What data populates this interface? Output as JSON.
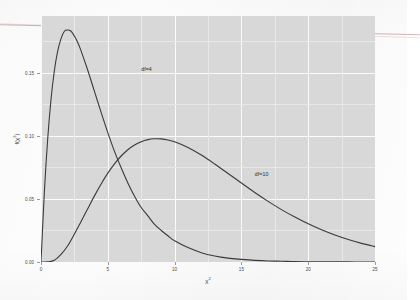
{
  "chart_data": {
    "type": "line",
    "title": "",
    "subtitle": "",
    "xlabel": "χ²",
    "ylabel": "f(χ²)",
    "xlim": [
      0,
      25
    ],
    "ylim": [
      0,
      0.195
    ],
    "grid": true,
    "legend": "none (in-plot curve annotations)",
    "panel_background": "#d8d8d8",
    "gridline_color": "#fbfbfb",
    "curve_color": "#3a3a3a",
    "x_ticks": [
      {
        "value": 0,
        "label": "0"
      },
      {
        "value": 5,
        "label": "5"
      },
      {
        "value": 10,
        "label": "10"
      },
      {
        "value": 15,
        "label": "15"
      },
      {
        "value": 20,
        "label": "20"
      },
      {
        "value": 25,
        "label": "25"
      }
    ],
    "y_ticks": [
      {
        "value": 0.0,
        "label": "0.00"
      },
      {
        "value": 0.05,
        "label": "0.05"
      },
      {
        "value": 0.1,
        "label": "0.10"
      },
      {
        "value": 0.15,
        "label": "0.15"
      }
    ],
    "annotations": [
      {
        "text": "df=4",
        "x": 7.5,
        "y": 0.155
      },
      {
        "text": "df=10",
        "x": 16.0,
        "y": 0.072
      }
    ],
    "series": [
      {
        "name": "df=4",
        "df": 4,
        "peak_x": 2.0,
        "peak_y": 0.1839,
        "x": [
          0,
          0.25,
          0.5,
          0.75,
          1,
          1.25,
          1.5,
          1.75,
          2,
          2.25,
          2.5,
          2.75,
          3,
          3.5,
          4,
          4.5,
          5,
          5.5,
          6,
          6.5,
          7,
          7.5,
          8,
          8.5,
          9,
          9.5,
          10,
          11,
          12,
          13,
          14,
          15,
          16,
          17,
          18,
          19,
          20,
          21,
          22,
          23,
          24,
          25
        ],
        "y": [
          0,
          0.0551,
          0.0973,
          0.129,
          0.1516,
          0.1671,
          0.1771,
          0.1829,
          0.1839,
          0.1829,
          0.1791,
          0.174,
          0.1674,
          0.152,
          0.1353,
          0.1186,
          0.1026,
          0.0877,
          0.0747,
          0.0627,
          0.0522,
          0.0432,
          0.0366,
          0.0298,
          0.025,
          0.0208,
          0.0168,
          0.0114,
          0.0074,
          0.0048,
          0.0031,
          0.0021,
          0.0013,
          0.0008,
          0.0006,
          0.0003,
          0.0002,
          0.00014,
          9e-05,
          6e-05,
          4e-05,
          2e-05
        ]
      },
      {
        "name": "df=10",
        "df": 10,
        "peak_x": 8.0,
        "peak_y": 0.0977,
        "x": [
          0,
          0.5,
          1,
          1.5,
          2,
          2.5,
          3,
          3.5,
          4,
          4.5,
          5,
          5.5,
          6,
          6.5,
          7,
          7.5,
          8,
          8.5,
          9,
          9.5,
          10,
          11,
          12,
          13,
          14,
          15,
          16,
          17,
          18,
          19,
          20,
          21,
          22,
          23,
          24,
          25
        ],
        "y": [
          0,
          4e-05,
          0.00079,
          0.00355,
          0.00766,
          0.01324,
          0.01918,
          0.02521,
          0.03125,
          0.03689,
          0.04198,
          0.0464,
          0.05009,
          0.05305,
          0.05529,
          0.05686,
          0.05783,
          0.05824,
          0.05816,
          0.05765,
          0.05678,
          0.05411,
          0.05053,
          0.04633,
          0.04185,
          0.0373,
          0.03286,
          0.02865,
          0.02476,
          0.02122,
          0.01805,
          0.01524,
          0.01277,
          0.01064,
          0.0088,
          0.00724
        ]
      }
    ],
    "note": "Two chi-squared probability density curves plotted on one panel; df=10 curve is rendered scaled so its peak reaches ~0.098 at x=8."
  }
}
